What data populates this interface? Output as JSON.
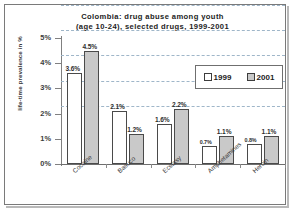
{
  "chart_data": {
    "type": "bar",
    "title": "Colombia: drug abuse among youth (age 10-24), selected drugs, 1999-2001",
    "title_line1": "Colombia: drug abuse among youth",
    "title_line2": "(age 10-24), selected drugs, 1999-2001",
    "xlabel": "",
    "ylabel": "life-time prevalence in %",
    "ylim": [
      0,
      5
    ],
    "grid": true,
    "legend_position": "top-right",
    "categories": [
      "Cocaine",
      "Basuco",
      "Ecstasy",
      "Amphetamines",
      "Heroin"
    ],
    "ytick_labels": [
      "0%",
      "1%",
      "2%",
      "3%",
      "4%",
      "5%"
    ],
    "ytick_values": [
      0,
      1,
      2,
      3,
      4,
      5
    ],
    "series": [
      {
        "name": "1999",
        "color": "#ffffff",
        "values": [
          3.6,
          2.1,
          1.6,
          0.7,
          0.8
        ],
        "labels": [
          "3.6%",
          "2.1%",
          "1.6%",
          "0.7%",
          "0.8%"
        ]
      },
      {
        "name": "2001",
        "color": "#c9c9c9",
        "values": [
          4.5,
          1.2,
          2.2,
          1.1,
          1.1
        ],
        "labels": [
          "4.5%",
          "1.2%",
          "2.2%",
          "1.1%",
          "1.1%"
        ]
      }
    ]
  },
  "legend": {
    "entries": [
      {
        "label": "1999"
      },
      {
        "label": "2001"
      }
    ]
  }
}
